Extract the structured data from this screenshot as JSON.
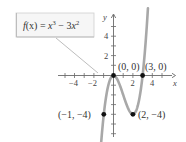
{
  "chart_data": {
    "type": "line",
    "title": "",
    "function_label": "f(x) = x^3 - 3x^2",
    "xlabel": "x",
    "ylabel": "y",
    "x_ticks": [
      -4,
      -2,
      2,
      4
    ],
    "y_ticks": [
      2,
      4
    ],
    "xlim": [
      -5,
      5
    ],
    "ylim": [
      -6,
      6
    ],
    "grid": false,
    "series": [
      {
        "name": "f(x) = x^3 - 3x^2",
        "expression": "x^3 - 3x^2",
        "domain": [
          -1.35,
          3.55
        ],
        "color": "#a8a8a8"
      }
    ],
    "points": [
      {
        "x": 0,
        "y": 0,
        "label": "(0, 0)"
      },
      {
        "x": 3,
        "y": 0,
        "label": "(3, 0)"
      },
      {
        "x": -1,
        "y": -4,
        "label": "(−1, −4)"
      },
      {
        "x": 2,
        "y": -4,
        "label": "(2, −4)"
      }
    ]
  },
  "labels": {
    "function_box": {
      "f": "f",
      "paren_x": "(x)",
      "eq": " = ",
      "x1": "x",
      "exp1": "3",
      "minus": " − 3",
      "x2": "x",
      "exp2": "2"
    },
    "x_axis": "x",
    "y_axis": "y",
    "ticks": {
      "xm4": "−4",
      "xm2": "−2",
      "x2": "2",
      "x4": "4",
      "y2": "2",
      "y4": "4"
    },
    "points": {
      "origin": "(0, 0)",
      "root3": "(3, 0)",
      "localmin_left": "(−1, −4)",
      "localmin": "(2, −4)"
    }
  },
  "colors": {
    "curve": "#a8a8a8",
    "axis": "#6a6a6a",
    "point": "#111111",
    "box_border": "#c8c8c8",
    "box_fill": "#f7f7f7"
  }
}
